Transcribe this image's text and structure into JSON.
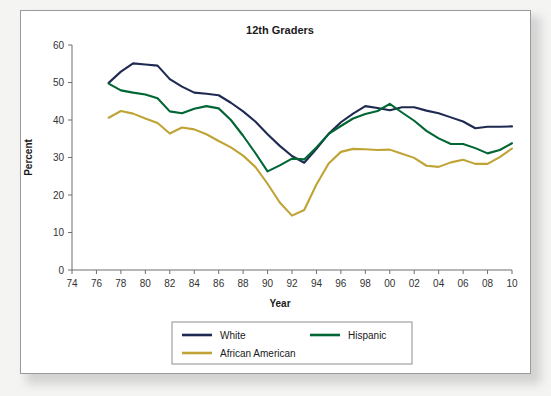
{
  "page": {
    "background_color": "#f4f4f3",
    "sheet_color": "#ffffff",
    "border_color": "#9a9a9a"
  },
  "chart_data": {
    "type": "line",
    "title": "12th Graders",
    "xlabel": "Year",
    "ylabel": "Percent",
    "ylim": [
      0,
      60
    ],
    "xlim": [
      1974,
      2010
    ],
    "grid": false,
    "legend_position": "bottom",
    "ytick_labels": [
      "0",
      "10",
      "20",
      "30",
      "40",
      "50",
      "60"
    ],
    "ytick_values": [
      0,
      10,
      20,
      30,
      40,
      50,
      60
    ],
    "xtick_labels": [
      "74",
      "76",
      "78",
      "80",
      "82",
      "84",
      "86",
      "88",
      "90",
      "92",
      "94",
      "96",
      "98",
      "00",
      "02",
      "04",
      "06",
      "08",
      "10"
    ],
    "xtick_values": [
      1974,
      1976,
      1978,
      1980,
      1982,
      1984,
      1986,
      1988,
      1990,
      1992,
      1994,
      1996,
      1998,
      2000,
      2002,
      2004,
      2006,
      2008,
      2010
    ],
    "x": [
      1977,
      1978,
      1979,
      1980,
      1981,
      1982,
      1983,
      1984,
      1985,
      1986,
      1987,
      1988,
      1989,
      1990,
      1991,
      1992,
      1993,
      1994,
      1995,
      1996,
      1997,
      1998,
      1999,
      2000,
      2001,
      2002,
      2003,
      2004,
      2005,
      2006,
      2007,
      2008,
      2009,
      2010
    ],
    "series": [
      {
        "name": "White",
        "color": "#1f2a52",
        "values": [
          49.9,
          52.9,
          55.1,
          54.8,
          54.5,
          50.9,
          48.9,
          47.3,
          47.0,
          46.6,
          44.6,
          42.3,
          39.6,
          36.2,
          33.1,
          30.4,
          28.6,
          32.3,
          36.3,
          39.4,
          41.7,
          43.7,
          43.2,
          42.6,
          43.4,
          43.4,
          42.5,
          41.8,
          40.7,
          39.6,
          37.8,
          38.2,
          38.2,
          38.3
        ]
      },
      {
        "name": "Hispanic",
        "color": "#006633",
        "values": [
          49.7,
          47.9,
          47.3,
          46.8,
          45.8,
          42.3,
          41.8,
          43.0,
          43.7,
          43.1,
          40.0,
          35.8,
          31.2,
          26.3,
          27.9,
          29.7,
          29.5,
          32.7,
          36.3,
          38.4,
          40.4,
          41.6,
          42.4,
          44.3,
          42.0,
          39.8,
          37.1,
          35.1,
          33.6,
          33.6,
          32.5,
          31.1,
          32.0,
          33.8
        ]
      },
      {
        "name": "African American",
        "color": "#bfa435",
        "values": [
          40.6,
          42.4,
          41.7,
          40.4,
          39.2,
          36.4,
          38.0,
          37.5,
          36.2,
          34.4,
          32.7,
          30.5,
          27.5,
          23.0,
          18.0,
          14.5,
          16.0,
          22.8,
          28.4,
          31.5,
          32.3,
          32.2,
          32.0,
          32.1,
          31.0,
          29.9,
          27.8,
          27.5,
          28.7,
          29.4,
          28.3,
          28.3,
          30.1,
          32.4
        ]
      }
    ],
    "legend": [
      {
        "label": "White",
        "color": "#1f2a52"
      },
      {
        "label": "Hispanic",
        "color": "#006633"
      },
      {
        "label": "African American",
        "color": "#bfa435"
      }
    ]
  }
}
